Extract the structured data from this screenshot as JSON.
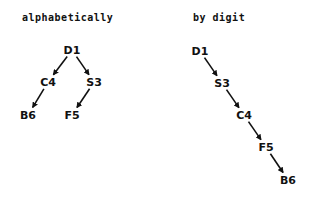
{
  "diagrams": [
    {
      "title": "alphabetically",
      "nodes": [
        {
          "id": "D1",
          "label": "D1",
          "x": 72,
          "y": 50
        },
        {
          "id": "C4",
          "label": "C4",
          "x": 48,
          "y": 82
        },
        {
          "id": "S3",
          "label": "S3",
          "x": 94,
          "y": 82
        },
        {
          "id": "B6",
          "label": "B6",
          "x": 28,
          "y": 115
        },
        {
          "id": "F5",
          "label": "F5",
          "x": 72,
          "y": 115
        }
      ],
      "edges": [
        [
          "D1",
          "C4"
        ],
        [
          "D1",
          "S3"
        ],
        [
          "C4",
          "B6"
        ],
        [
          "S3",
          "F5"
        ]
      ]
    },
    {
      "title": "by digit",
      "nodes": [
        {
          "id": "D1",
          "label": "D1",
          "x": 200,
          "y": 51
        },
        {
          "id": "S3",
          "label": "S3",
          "x": 222,
          "y": 83
        },
        {
          "id": "C4",
          "label": "C4",
          "x": 244,
          "y": 115
        },
        {
          "id": "F5",
          "label": "F5",
          "x": 266,
          "y": 147
        },
        {
          "id": "B6",
          "label": "B6",
          "x": 288,
          "y": 180
        }
      ],
      "edges": [
        [
          "D1",
          "S3"
        ],
        [
          "S3",
          "C4"
        ],
        [
          "C4",
          "F5"
        ],
        [
          "F5",
          "B6"
        ]
      ]
    }
  ]
}
